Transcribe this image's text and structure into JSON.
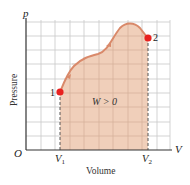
{
  "diagram": {
    "type": "pV-diagram",
    "axes": {
      "origin_label": "O",
      "x_axis_symbol": "V",
      "y_axis_symbol": "p",
      "x_axis_title": "Volume",
      "y_axis_title": "Pressure"
    },
    "ticks": {
      "v1": "V",
      "v1_sub": "1",
      "v2": "V",
      "v2_sub": "2"
    },
    "points": [
      {
        "label": "1",
        "color": "#e8211f"
      },
      {
        "label": "2",
        "color": "#e8211f"
      }
    ],
    "area_label": "W > 0",
    "colors": {
      "curve": "#d9896a",
      "fill": "#eecab3",
      "grid": "#c8c8c8",
      "axis": "#333333",
      "point": "#e8211f"
    }
  }
}
